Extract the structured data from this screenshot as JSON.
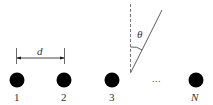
{
  "diagram": {
    "colors": {
      "ink": "#1a1a1a",
      "dots": "#000000",
      "text": "#333333",
      "background": "#ffffff"
    },
    "elements": [
      {
        "id": "1",
        "label": "1"
      },
      {
        "id": "2",
        "label": "2"
      },
      {
        "id": "3",
        "label": "3"
      },
      {
        "id": "N",
        "label": "N"
      }
    ],
    "ellipsis": "...",
    "spacing_label": "d",
    "angle_label": "θ"
  }
}
